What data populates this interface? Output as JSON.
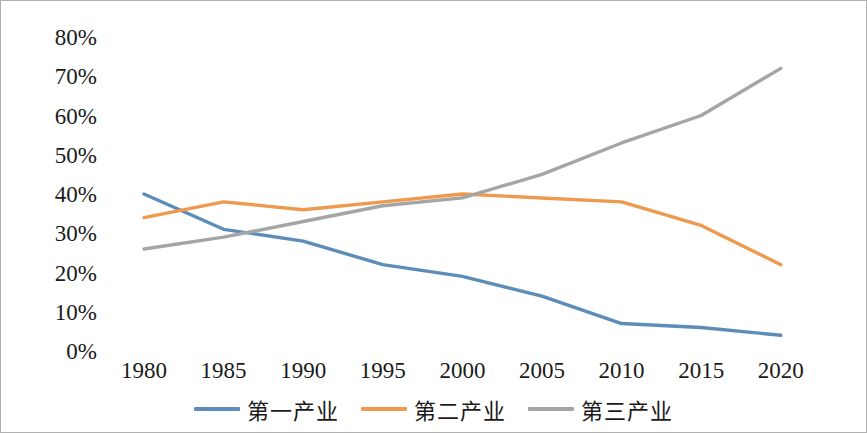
{
  "chart_data": {
    "type": "line",
    "title": "",
    "xlabel": "",
    "ylabel": "",
    "grid": false,
    "legend_position": "bottom",
    "categories": [
      "1980",
      "1985",
      "1990",
      "1995",
      "2000",
      "2005",
      "2010",
      "2015",
      "2020"
    ],
    "ylim": [
      0,
      80
    ],
    "ytick_labels": [
      "80%",
      "70%",
      "60%",
      "50%",
      "40%",
      "30%",
      "20%",
      "10%",
      "0%"
    ],
    "ytick_values": [
      80,
      70,
      60,
      50,
      40,
      30,
      20,
      10,
      0
    ],
    "series": [
      {
        "name": "第一产业",
        "color": "#5B8DB8",
        "values": [
          40,
          31,
          28,
          22,
          19,
          14,
          7,
          6,
          4
        ]
      },
      {
        "name": "第二产业",
        "color": "#ED9A4E",
        "values": [
          34,
          38,
          36,
          38,
          40,
          39,
          38,
          32,
          22
        ]
      },
      {
        "name": "第三产业",
        "color": "#A5A5A5",
        "values": [
          26,
          29,
          33,
          37,
          39,
          45,
          53,
          60,
          72
        ]
      }
    ]
  },
  "colors": {
    "series_1": "#5B8DB8",
    "series_2": "#ED9A4E",
    "series_3": "#A5A5A5",
    "border": "#b0b0b0",
    "text": "#1a1a1a"
  }
}
